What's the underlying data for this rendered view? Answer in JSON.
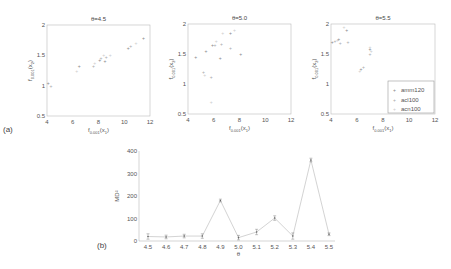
{
  "panel_labels": {
    "a": "(a)",
    "b": "(b)"
  },
  "chart_data": [
    {
      "type": "scatter",
      "title": "θ=4.5",
      "xlabel": "f_{0.001}(x_1)",
      "ylabel": "f_{0.001}(x_2)",
      "xlim": [
        4,
        12
      ],
      "ylim": [
        0.5,
        2
      ],
      "xticks": [
        "4",
        "6",
        "8",
        "10",
        "12"
      ],
      "yticks": [
        "0.5",
        "1",
        "1.5",
        "2"
      ],
      "points": [
        [
          4.1,
          1.05
        ],
        [
          4.3,
          1.0
        ],
        [
          6.3,
          1.25
        ],
        [
          6.5,
          1.32
        ],
        [
          7.6,
          1.33
        ],
        [
          7.7,
          1.37
        ],
        [
          8.1,
          1.42
        ],
        [
          8.2,
          1.45
        ],
        [
          8.4,
          1.5
        ],
        [
          8.5,
          1.4
        ],
        [
          8.6,
          1.48
        ],
        [
          8.9,
          1.5
        ],
        [
          10.3,
          1.62
        ],
        [
          10.5,
          1.65
        ],
        [
          10.9,
          1.7
        ],
        [
          11.5,
          1.78
        ]
      ]
    },
    {
      "type": "scatter",
      "title": "θ=5.0",
      "xlabel": "f_{0.001}(x_1)",
      "ylabel": "f_{0.001}(x_2)",
      "xlim": [
        4,
        12
      ],
      "ylim": [
        0.5,
        2
      ],
      "xticks": [
        "4",
        "6",
        "8",
        "10",
        "12"
      ],
      "yticks": [
        "0.5",
        "1",
        "1.5",
        "2"
      ],
      "points": [
        [
          4.6,
          1.45
        ],
        [
          5.2,
          1.2
        ],
        [
          5.3,
          1.15
        ],
        [
          5.4,
          1.55
        ],
        [
          5.8,
          1.12
        ],
        [
          5.8,
          0.7
        ],
        [
          5.9,
          1.65
        ],
        [
          6.1,
          1.65
        ],
        [
          6.2,
          1.72
        ],
        [
          6.5,
          1.43
        ],
        [
          6.6,
          1.67
        ],
        [
          6.7,
          1.85
        ],
        [
          7.3,
          1.85
        ],
        [
          7.3,
          1.6
        ],
        [
          7.6,
          1.9
        ],
        [
          8.1,
          1.5
        ]
      ]
    },
    {
      "type": "scatter",
      "title": "θ=5.5",
      "xlabel": "f_{0.001}(x_1)",
      "ylabel": "f_{0.001}(x_2)",
      "xlim": [
        4,
        12
      ],
      "ylim": [
        0.5,
        2
      ],
      "xticks": [
        "4",
        "6",
        "8",
        "10",
        "12"
      ],
      "yticks": [
        "0.5",
        "1",
        "1.5",
        "2"
      ],
      "legend": [
        "amm120",
        "acl100",
        "acn100"
      ],
      "legend_position": "lower right",
      "points": [
        [
          4.1,
          1.7
        ],
        [
          4.3,
          1.72
        ],
        [
          4.5,
          1.74
        ],
        [
          4.6,
          1.75
        ],
        [
          4.7,
          1.68
        ],
        [
          5.0,
          1.95
        ],
        [
          5.2,
          1.9
        ],
        [
          5.3,
          1.7
        ],
        [
          6.2,
          1.22
        ],
        [
          6.3,
          1.25
        ],
        [
          6.5,
          1.28
        ],
        [
          7.0,
          1.62
        ],
        [
          7.0,
          1.58
        ],
        [
          7.0,
          1.5
        ],
        [
          7.1,
          1.55
        ]
      ]
    },
    {
      "type": "line",
      "title": "",
      "xlabel": "θ",
      "ylabel": "MD²",
      "ylim": [
        0,
        400
      ],
      "yticks": [
        "0",
        "100",
        "200",
        "300",
        "400"
      ],
      "categories": [
        "4.5",
        "4.6",
        "4.7",
        "4.8",
        "4.9",
        "5.0",
        "5.1",
        "5.2",
        "5.3",
        "5.4",
        "5.5"
      ],
      "values": [
        20,
        18,
        22,
        22,
        180,
        15,
        40,
        102,
        22,
        360,
        30
      ],
      "errors": [
        12,
        8,
        8,
        10,
        6,
        10,
        12,
        10,
        14,
        8,
        6
      ]
    }
  ]
}
